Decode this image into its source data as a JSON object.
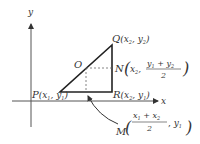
{
  "diagram": {
    "axes": {
      "x_label": "x",
      "y_label": "y"
    },
    "points": {
      "P": {
        "name": "P",
        "coord": "(x",
        "sub1": "1",
        "mid": ", y",
        "sub2": "1",
        "close": ")"
      },
      "Q": {
        "name": "Q",
        "coord": "(x",
        "sub1": "2",
        "mid": ", y",
        "sub2": "2",
        "close": ")"
      },
      "R": {
        "name": "R",
        "coord": "(x",
        "sub1": "2",
        "mid": ", y",
        "sub2": "1",
        "close": ")"
      },
      "O": {
        "name": "O"
      },
      "N": {
        "name": "N",
        "x": "x",
        "x_sub": "2",
        "num_a": "y",
        "num_a_sub": "1",
        "plus": "+",
        "num_b": "y",
        "num_b_sub": "2",
        "den": "2"
      },
      "M": {
        "name": "M",
        "num_a": "x",
        "num_a_sub": "1",
        "plus": "+",
        "num_b": "x",
        "num_b_sub": "2",
        "den": "2",
        "y": "y",
        "y_sub": "1"
      }
    },
    "colors": {
      "stroke": "#222222",
      "axis": "#555555",
      "dashed": "#666666",
      "text": "#333333"
    }
  }
}
